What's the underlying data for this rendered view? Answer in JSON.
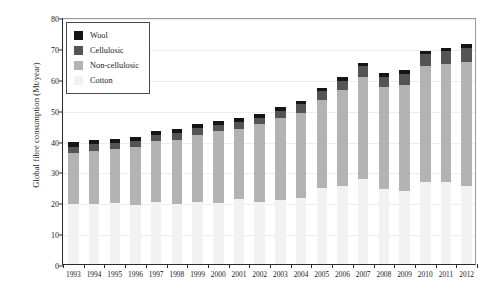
{
  "chart_data": {
    "type": "bar",
    "subtype": "stacked-column",
    "title": "",
    "xlabel": "",
    "ylabel": "Global fibre consumption (Mt/year)",
    "ylim": [
      0,
      80
    ],
    "ytick_step": 10,
    "yticks": [
      "0",
      "10",
      "20",
      "30",
      "40",
      "50",
      "60",
      "70",
      "80"
    ],
    "grid": true,
    "grid_axis": "y",
    "legend_position": "top-left",
    "categories": [
      "1993",
      "1994",
      "1995",
      "1996",
      "1997",
      "1998",
      "1999",
      "2000",
      "2001",
      "2002",
      "2003",
      "2004",
      "2005",
      "2006",
      "2007",
      "2008",
      "2009",
      "2010",
      "2011",
      "2012"
    ],
    "series": [
      {
        "name": "Cotton",
        "color": "#f2f2f2",
        "values": [
          19.3,
          19.6,
          19.8,
          19.2,
          20.1,
          19.4,
          20.0,
          19.8,
          21.2,
          20.0,
          20.8,
          21.5,
          24.5,
          25.4,
          27.5,
          24.3,
          23.5,
          26.5,
          26.6,
          25.2
        ]
      },
      {
        "name": "Non-cellulosic",
        "color": "#b3b3b3",
        "values": [
          16.5,
          17.0,
          17.3,
          18.8,
          19.6,
          20.9,
          21.9,
          23.2,
          22.6,
          25.2,
          26.4,
          27.5,
          28.5,
          31.0,
          33.2,
          33.0,
          34.6,
          37.5,
          38.2,
          40.3
        ]
      },
      {
        "name": "Cellulosic",
        "color": "#545454",
        "values": [
          2.2,
          2.2,
          2.1,
          2.0,
          2.1,
          2.1,
          2.1,
          2.1,
          2.1,
          2.2,
          2.4,
          2.7,
          2.9,
          3.0,
          3.3,
          3.3,
          3.5,
          3.9,
          4.2,
          4.5
        ]
      },
      {
        "name": "Wool",
        "color": "#151515",
        "values": [
          1.5,
          1.4,
          1.4,
          1.3,
          1.3,
          1.3,
          1.3,
          1.3,
          1.3,
          1.3,
          1.2,
          1.2,
          1.2,
          1.2,
          1.2,
          1.2,
          1.1,
          1.1,
          1.1,
          1.1
        ]
      }
    ],
    "totals": [
      39.5,
      40.2,
      40.6,
      41.3,
      43.1,
      43.7,
      45.3,
      46.4,
      47.2,
      48.7,
      50.8,
      52.9,
      57.1,
      60.6,
      65.2,
      61.8,
      62.7,
      69.0,
      70.1,
      71.1
    ],
    "annotations": []
  },
  "legend": {
    "items": [
      {
        "label": "Wool",
        "color": "#151515"
      },
      {
        "label": "Cellulosic",
        "color": "#545454"
      },
      {
        "label": "Non-cellulosic",
        "color": "#b3b3b3"
      },
      {
        "label": "Cotton",
        "color": "#f2f2f2"
      }
    ]
  }
}
